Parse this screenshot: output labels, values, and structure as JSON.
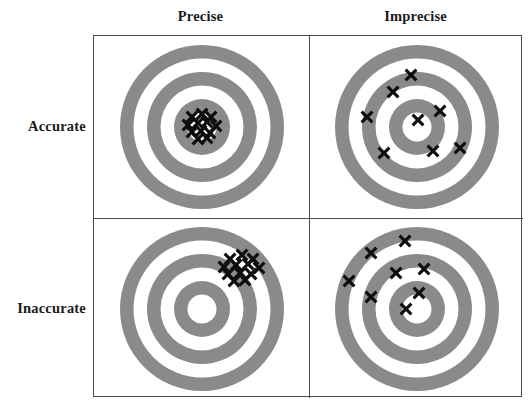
{
  "figure": {
    "title_text": "",
    "column_headers": [
      {
        "key": "precise",
        "label": "Precise"
      },
      {
        "key": "imprecise",
        "label": "Imprecise"
      }
    ],
    "row_labels": [
      {
        "key": "accurate",
        "label": "Accurate"
      },
      {
        "key": "inaccurate",
        "label": "Inaccurate"
      }
    ],
    "colors": {
      "ring_gray": "#8a8a8a",
      "ring_white": "#ffffff",
      "mark_black": "#0d0d0d",
      "frame_line": "#4a4a4a",
      "background": "#ffffff",
      "text": "#1a1a1a"
    }
  },
  "chart_data": {
    "type": "scatter",
    "xlabel": "",
    "ylabel": "",
    "grid": false,
    "legend": null,
    "layout": {
      "rows": [
        "Accurate",
        "Inaccurate"
      ],
      "columns": [
        "Precise",
        "Imprecise"
      ],
      "panel_count": 4
    },
    "target": {
      "description": "Concentric bullseye: 3 gray rings alternating with white gaps, white center bullseye",
      "view_box": [
        0,
        0,
        180,
        180
      ],
      "center": [
        90,
        90
      ],
      "rings": [
        {
          "index": 1,
          "radius": 82.0,
          "fill": "#8a8a8a"
        },
        {
          "index": 2,
          "radius": 68.5,
          "fill": "#ffffff"
        },
        {
          "index": 3,
          "radius": 55.0,
          "fill": "#8a8a8a"
        },
        {
          "index": 4,
          "radius": 41.5,
          "fill": "#ffffff"
        },
        {
          "index": 5,
          "radius": 28.0,
          "fill": "#8a8a8a"
        },
        {
          "index": 6,
          "radius": 14.5,
          "fill": "#ffffff"
        }
      ]
    },
    "panels": [
      {
        "key": "accurate-precise",
        "row": "Accurate",
        "column": "Precise",
        "caption": "Accurate and Precise",
        "description": "Tight cluster of shots centered on the bullseye",
        "mark_count": 12,
        "marks": [
          {
            "x": 80,
            "y": 80
          },
          {
            "x": 90,
            "y": 77
          },
          {
            "x": 99,
            "y": 80
          },
          {
            "x": 76,
            "y": 88
          },
          {
            "x": 86,
            "y": 86
          },
          {
            "x": 95,
            "y": 85
          },
          {
            "x": 104,
            "y": 89
          },
          {
            "x": 80,
            "y": 95
          },
          {
            "x": 89,
            "y": 94
          },
          {
            "x": 98,
            "y": 96
          },
          {
            "x": 86,
            "y": 102
          },
          {
            "x": 95,
            "y": 101
          }
        ]
      },
      {
        "key": "accurate-imprecise",
        "row": "Accurate",
        "column": "Imprecise",
        "caption": "Accurate but Imprecise",
        "description": "Shots scattered widely but averaging on the bullseye",
        "mark_count": 8,
        "marks": [
          {
            "x": 84,
            "y": 38
          },
          {
            "x": 66,
            "y": 55
          },
          {
            "x": 40,
            "y": 80
          },
          {
            "x": 113,
            "y": 74
          },
          {
            "x": 91,
            "y": 83
          },
          {
            "x": 57,
            "y": 116
          },
          {
            "x": 106,
            "y": 114
          },
          {
            "x": 133,
            "y": 111
          }
        ]
      },
      {
        "key": "inaccurate-precise",
        "row": "Inaccurate",
        "column": "Precise",
        "caption": "Inaccurate but Precise",
        "description": "Tight cluster of shots offset up and to the right of the bullseye",
        "mark_count": 12,
        "marks": [
          {
            "x": 118,
            "y": 40
          },
          {
            "x": 130,
            "y": 36
          },
          {
            "x": 141,
            "y": 40
          },
          {
            "x": 112,
            "y": 48
          },
          {
            "x": 124,
            "y": 46
          },
          {
            "x": 136,
            "y": 45
          },
          {
            "x": 147,
            "y": 49
          },
          {
            "x": 116,
            "y": 55
          },
          {
            "x": 128,
            "y": 54
          },
          {
            "x": 139,
            "y": 55
          },
          {
            "x": 122,
            "y": 62
          },
          {
            "x": 133,
            "y": 61
          }
        ]
      },
      {
        "key": "inaccurate-imprecise",
        "row": "Inaccurate",
        "column": "Imprecise",
        "caption": "Inaccurate and Imprecise",
        "description": "Shots scattered widely and biased to the upper-left of the bullseye",
        "mark_count": 8,
        "marks": [
          {
            "x": 78,
            "y": 22
          },
          {
            "x": 44,
            "y": 34
          },
          {
            "x": 22,
            "y": 62
          },
          {
            "x": 69,
            "y": 54
          },
          {
            "x": 97,
            "y": 50
          },
          {
            "x": 44,
            "y": 78
          },
          {
            "x": 92,
            "y": 74
          },
          {
            "x": 79,
            "y": 90
          }
        ]
      }
    ]
  }
}
